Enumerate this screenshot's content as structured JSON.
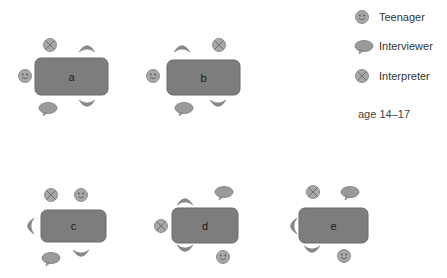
{
  "diagram": {
    "title": "",
    "colors": {
      "table_fill": "#7d7d7d",
      "icon_fill": "#9a9a9a",
      "icon_stroke": "#7a7a7a",
      "background": "#ffffff"
    },
    "tables": [
      {
        "id": "a",
        "label": "a",
        "x": 35,
        "y": 58,
        "w": 73,
        "h": 37,
        "seats": [
          {
            "role": "interpreter",
            "x": 50,
            "y": 45
          },
          {
            "role": "empty-chair-top",
            "x": 87,
            "y": 48
          },
          {
            "role": "teenager",
            "x": 25,
            "y": 76
          },
          {
            "role": "interviewer",
            "x": 48,
            "y": 108
          },
          {
            "role": "empty-chair-bottom",
            "x": 87,
            "y": 104
          }
        ]
      },
      {
        "id": "b",
        "label": "b",
        "x": 167,
        "y": 60,
        "w": 73,
        "h": 35,
        "seats": [
          {
            "role": "empty-chair-top",
            "x": 182,
            "y": 48
          },
          {
            "role": "interpreter",
            "x": 219,
            "y": 45
          },
          {
            "role": "teenager",
            "x": 153,
            "y": 76
          },
          {
            "role": "interviewer",
            "x": 184,
            "y": 108
          },
          {
            "role": "empty-chair-bottom",
            "x": 218,
            "y": 104
          }
        ]
      },
      {
        "id": "c",
        "label": "c",
        "x": 41,
        "y": 210,
        "w": 65,
        "h": 32,
        "seats": [
          {
            "role": "interpreter",
            "x": 51,
            "y": 195
          },
          {
            "role": "teenager",
            "x": 81,
            "y": 195
          },
          {
            "role": "empty-chair-left",
            "x": 30,
            "y": 226
          },
          {
            "role": "interviewer",
            "x": 51,
            "y": 258
          },
          {
            "role": "empty-chair-bottom",
            "x": 81,
            "y": 254
          }
        ]
      },
      {
        "id": "d",
        "label": "d",
        "x": 172,
        "y": 208,
        "w": 66,
        "h": 35,
        "seats": [
          {
            "role": "empty-chair-top",
            "x": 185,
            "y": 201
          },
          {
            "role": "interviewer",
            "x": 224,
            "y": 192
          },
          {
            "role": "interpreter",
            "x": 161,
            "y": 226
          },
          {
            "role": "empty-chair-bottom",
            "x": 185,
            "y": 249
          },
          {
            "role": "teenager",
            "x": 223,
            "y": 257
          }
        ]
      },
      {
        "id": "e",
        "label": "e",
        "x": 299,
        "y": 208,
        "w": 69,
        "h": 35,
        "seats": [
          {
            "role": "interpreter",
            "x": 313,
            "y": 192
          },
          {
            "role": "interviewer",
            "x": 350,
            "y": 192
          },
          {
            "role": "empty-chair-left",
            "x": 293,
            "y": 226
          },
          {
            "role": "empty-chair-bottom",
            "x": 312,
            "y": 250
          },
          {
            "role": "teenager",
            "x": 344,
            "y": 256
          }
        ]
      }
    ],
    "legend": {
      "items": [
        {
          "role": "teenager",
          "label": "Teenager",
          "icon": "smiley-face-icon"
        },
        {
          "role": "interviewer",
          "label": "Interviewer",
          "icon": "speech-bubble-icon"
        },
        {
          "role": "interpreter",
          "label": "Interpreter",
          "icon": "crossed-circle-icon"
        }
      ]
    },
    "note": "age 14–17"
  }
}
